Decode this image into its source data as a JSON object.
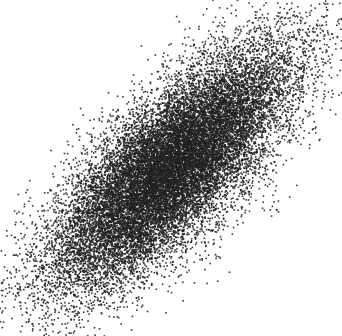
{
  "chart_data": {
    "type": "scatter",
    "title": "",
    "xlabel": "",
    "ylabel": "",
    "legend": [],
    "grid": false,
    "axes_visible": false,
    "description": "Dense bivariate-normal point cloud with strong positive correlation, elongated from lower-left to upper-right",
    "canvas": {
      "width": 342,
      "height": 336,
      "background": "#ffffff"
    },
    "distribution": {
      "kind": "bivariate_normal",
      "n_points": 20000,
      "center_px": [
        171,
        168
      ],
      "major_axis_angle_deg": 45,
      "sigma_major_px": 80,
      "sigma_minor_px": 30,
      "approx_correlation": 0.75,
      "extent_px": {
        "x": [
          0,
          335
        ],
        "y": [
          5,
          336
        ]
      }
    },
    "marker": {
      "color": "#222222",
      "size_px": 1.6,
      "alpha": 0.9
    },
    "seed": 12345
  }
}
